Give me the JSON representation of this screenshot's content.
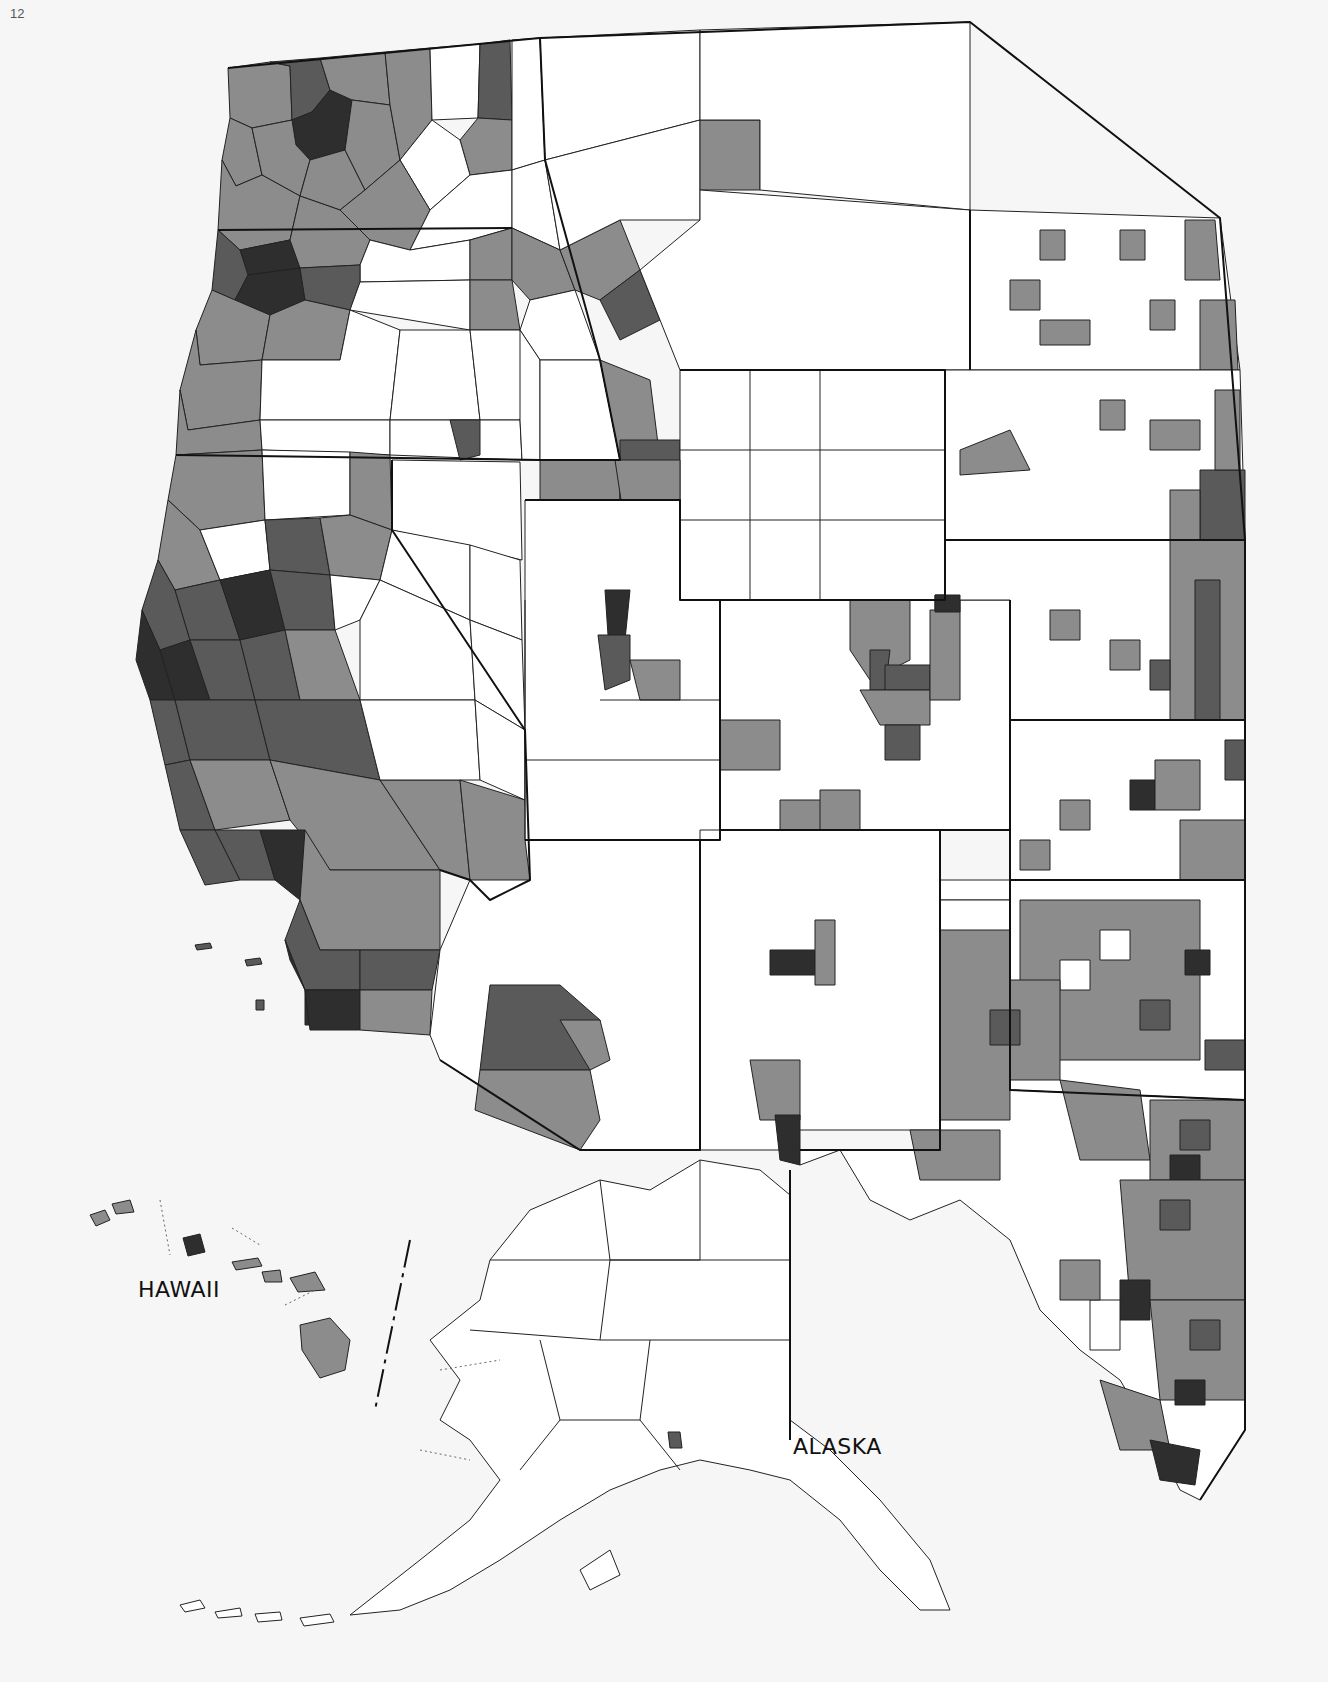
{
  "page": {
    "number": "12"
  },
  "map": {
    "title": "",
    "description": "Choropleth of western United States counties with Alaska and Hawaii insets",
    "labels": {
      "hawaii": "HAWAII",
      "alaska": "ALASKA"
    },
    "legend_classes": [
      {
        "class": 0,
        "color": "#ffffff"
      },
      {
        "class": 1,
        "color": "#8c8c8c"
      },
      {
        "class": 2,
        "color": "#5a5a5a"
      },
      {
        "class": 3,
        "color": "#2e2e2e"
      }
    ],
    "colors": {
      "background": "#f6f6f6",
      "border": "#222222"
    }
  }
}
